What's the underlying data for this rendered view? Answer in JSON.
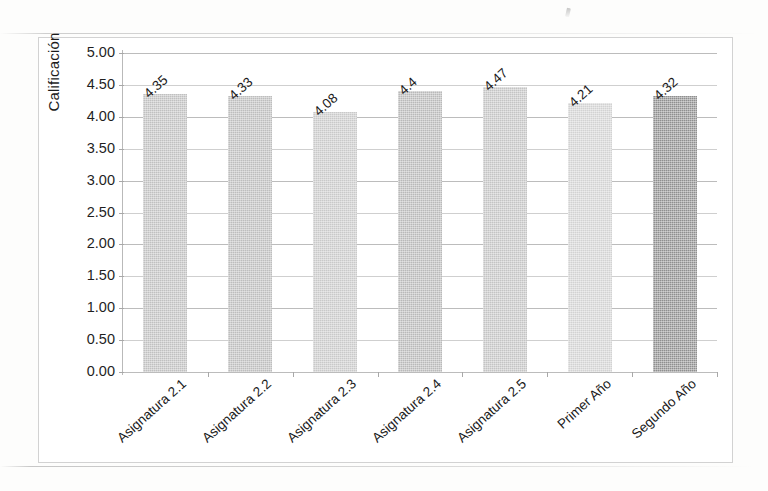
{
  "chart_data": {
    "type": "bar",
    "title": "",
    "subtitle": "",
    "xlabel": "",
    "ylabel": "Calificación",
    "ylim": [
      0.0,
      5.0
    ],
    "ytick_step": 0.5,
    "grid": true,
    "legend": false,
    "legend_position": "none",
    "categories": [
      "Asignatura 2.1",
      "Asignatura 2.2",
      "Asignatura 2.3",
      "Asignatura 2.4",
      "Asignatura 2.5",
      "Primer Año",
      "Segundo Año"
    ],
    "values": [
      4.35,
      4.33,
      4.08,
      4.4,
      4.47,
      4.21,
      4.32
    ],
    "data_labels": [
      "4.35",
      "4.33",
      "4.08",
      "4.4",
      "4.47",
      "4.21",
      "4.32"
    ],
    "ytick_labels": [
      "5.00",
      "4.50",
      "4.00",
      "3.50",
      "3.00",
      "2.50",
      "2.00",
      "1.50",
      "1.00",
      "0.50",
      "0.00"
    ],
    "ytick_values": [
      5.0,
      4.5,
      4.0,
      3.5,
      3.0,
      2.5,
      2.0,
      1.5,
      1.0,
      0.5,
      0.0
    ],
    "bar_colors": [
      "#c0c0c0",
      "#bdbdbd",
      "#c9c9c9",
      "#b9b9b9",
      "#c4c4c4",
      "#d2d2d2",
      "#8f8f8f"
    ]
  }
}
